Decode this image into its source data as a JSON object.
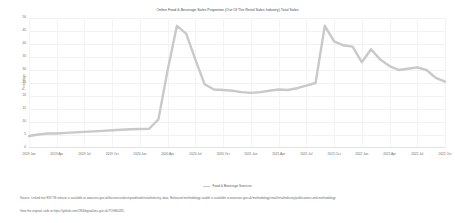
{
  "chart_title": "Online Food & Beverage Sales Proportion (Out Of The Retail Sales Industry) Total Sales",
  "axes": {
    "ylabel": "Percentage",
    "yticks": [
      "50",
      "45",
      "40",
      "35",
      "30",
      "25",
      "20",
      "15",
      "10",
      "5",
      "0"
    ],
    "xticks": [
      "2019 Jan",
      "2019 Apr",
      "2019 Jul",
      "2019 Oct",
      "2020 Jan",
      "2020 Apr",
      "2020 Jul",
      "2020 Oct",
      "2021 Jan",
      "2021 Apr",
      "2021 Jul",
      "2021 Oct",
      "2022 Jan",
      "2022 Apr",
      "2022 Jul",
      "2022 Oct"
    ]
  },
  "legend": {
    "label": "Food & Beverage Services",
    "swatch_color": "#c9c9c9"
  },
  "footnotes": {
    "source": "Source: Linked text RSI TB release is available at www.ons.gov.uk/businessindustryandtrade/retailindustry, data, Released methodology usable is available at www.ons.gov.uk/methodology/retail/retailindustry/publications-and-methodology",
    "link": "View the original code at https://github.com/ONSdigital/ons-gov.uk/TO/H40285"
  },
  "chart_data": {
    "type": "line",
    "title": "Online Food & Beverage Sales Proportion (Out Of The Retail Sales Industry) Total Sales",
    "xlabel": "",
    "ylabel": "Percentage",
    "ylim": [
      0,
      50
    ],
    "grid": true,
    "legend_position": "bottom",
    "series": [
      {
        "name": "Food & Beverage Services",
        "color": "#c9c9c9",
        "x": [
          "2019 Jan",
          "2019 Feb",
          "2019 Mar",
          "2019 Apr",
          "2019 May",
          "2019 Jun",
          "2019 Jul",
          "2019 Aug",
          "2019 Sep",
          "2019 Oct",
          "2019 Nov",
          "2019 Dec",
          "2020 Jan",
          "2020 Feb",
          "2020 Mar",
          "2020 Apr",
          "2020 May",
          "2020 Jun",
          "2020 Jul",
          "2020 Aug",
          "2020 Sep",
          "2020 Oct",
          "2020 Nov",
          "2020 Dec",
          "2021 Jan",
          "2021 Feb",
          "2021 Mar",
          "2021 Apr",
          "2021 May",
          "2021 Jun",
          "2021 Jul",
          "2021 Aug",
          "2021 Sep",
          "2021 Oct",
          "2021 Nov",
          "2021 Dec",
          "2022 Jan",
          "2022 Feb",
          "2022 Mar",
          "2022 Apr",
          "2022 May",
          "2022 Jun",
          "2022 Jul",
          "2022 Aug",
          "2022 Sep",
          "2022 Oct"
        ],
        "values": [
          4.6,
          5.2,
          5.6,
          5.6,
          5.8,
          6.0,
          6.2,
          6.4,
          6.6,
          6.8,
          7.0,
          7.2,
          7.3,
          7.4,
          11.0,
          30.0,
          47.0,
          44.0,
          34.0,
          24.5,
          22.5,
          22.3,
          22.0,
          21.5,
          21.2,
          21.5,
          22.0,
          22.5,
          22.3,
          23.0,
          24.0,
          25.0,
          47.0,
          41.0,
          39.5,
          39.0,
          33.0,
          38.0,
          34.0,
          31.5,
          30.0,
          30.5,
          31.0,
          30.0,
          27.0,
          25.5
        ]
      }
    ],
    "annotations": {
      "peak_1": {
        "x": "2020 May",
        "y": 47.0
      },
      "peak_2": {
        "x": "2021 Sep",
        "y": 47.0
      },
      "final": {
        "x": "2022 Oct",
        "y": 25.5
      }
    }
  }
}
